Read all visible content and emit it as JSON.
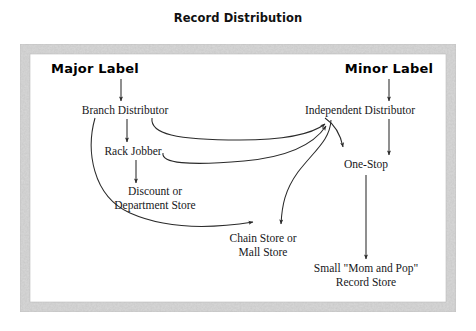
{
  "figure": {
    "title": "Record Distribution",
    "frame_color": "#c9c9c9",
    "background_color": "#ffffff",
    "line_color": "#2a2a2a"
  },
  "nodes": [
    {
      "id": "major-label",
      "label": "Major Label",
      "x": 95,
      "y": 70,
      "style": "bold",
      "lines": [
        "Major Label"
      ]
    },
    {
      "id": "minor-label",
      "label": "Minor Label",
      "x": 389,
      "y": 70,
      "style": "bold",
      "lines": [
        "Minor Label"
      ]
    },
    {
      "id": "branch-distributor",
      "label": "Branch Distributor",
      "x": 125,
      "y": 111,
      "style": "normal",
      "lines": [
        "Branch Distributor"
      ]
    },
    {
      "id": "independent-distributor",
      "label": "Independent Distributor",
      "x": 360,
      "y": 111,
      "style": "normal",
      "lines": [
        "Independent Distributor"
      ]
    },
    {
      "id": "rack-jobber",
      "label": "Rack Jobber",
      "x": 133,
      "y": 152,
      "style": "normal",
      "lines": [
        "Rack Jobber"
      ]
    },
    {
      "id": "one-stop",
      "label": "One-Stop",
      "x": 366,
      "y": 165,
      "style": "normal",
      "lines": [
        "One-Stop"
      ]
    },
    {
      "id": "discount-department-store",
      "label": "Discount or Department Store",
      "x": 155,
      "y": 192,
      "style": "normal",
      "lines": [
        "Discount or",
        "Department Store"
      ]
    },
    {
      "id": "chain-mall-store",
      "label": "Chain Store or Mall Store",
      "x": 263,
      "y": 239,
      "style": "normal",
      "lines": [
        "Chain Store or",
        "Mall Store"
      ]
    },
    {
      "id": "mom-and-pop-record-store",
      "label": "Small \"Mom and Pop\" Record Store",
      "x": 366,
      "y": 269,
      "style": "normal",
      "lines": [
        "Small \"Mom and Pop\"",
        "Record Store"
      ]
    }
  ],
  "edges": [
    {
      "id": "major-to-branch",
      "from": "major-label",
      "to": "branch-distributor",
      "kind": "straight"
    },
    {
      "id": "minor-to-independent",
      "from": "minor-label",
      "to": "independent-distributor",
      "kind": "straight"
    },
    {
      "id": "branch-to-rack",
      "from": "branch-distributor",
      "to": "rack-jobber",
      "kind": "straight"
    },
    {
      "id": "rack-to-discount",
      "from": "rack-jobber",
      "to": "discount-department-store",
      "kind": "straight"
    },
    {
      "id": "minor-to-one-stop",
      "from": "minor-label",
      "to": "one-stop",
      "kind": "straight"
    },
    {
      "id": "one-stop-to-mom-and-pop",
      "from": "one-stop",
      "to": "mom-and-pop-record-store",
      "kind": "straight"
    },
    {
      "id": "branch-to-independent",
      "from": "branch-distributor",
      "to": "independent-distributor",
      "kind": "curve"
    },
    {
      "id": "rack-to-independent",
      "from": "rack-jobber",
      "to": "independent-distributor",
      "kind": "curve"
    },
    {
      "id": "independent-to-one-stop",
      "from": "independent-distributor",
      "to": "one-stop",
      "kind": "curve"
    },
    {
      "id": "independent-to-chain-store",
      "from": "independent-distributor",
      "to": "chain-mall-store",
      "kind": "curve"
    },
    {
      "id": "branch-to-chain-store",
      "from": "branch-distributor",
      "to": "chain-mall-store",
      "kind": "curve"
    }
  ]
}
